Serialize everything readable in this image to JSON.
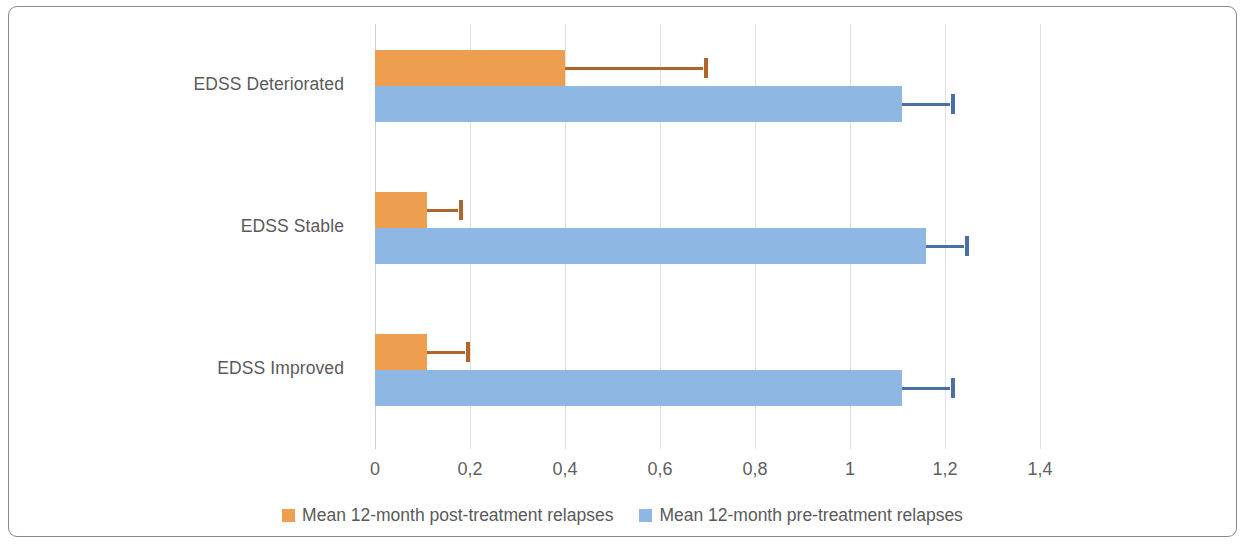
{
  "chart_data": {
    "type": "bar",
    "orientation": "horizontal",
    "title": "",
    "xlabel": "",
    "ylabel": "",
    "xlim": [
      0,
      1.4
    ],
    "xticks": [
      0,
      0.2,
      0.4,
      0.6,
      0.8,
      1,
      1.2,
      1.4
    ],
    "xtick_labels": [
      "0",
      "0,2",
      "0,4",
      "0,6",
      "0,8",
      "1",
      "1,2",
      "1,4"
    ],
    "grid": true,
    "legend_position": "bottom",
    "decimal_separator": ",",
    "categories": [
      "EDSS Improved",
      "EDSS Stable",
      "EDSS Deteriorated"
    ],
    "categories_top_to_bottom": [
      "EDSS Deteriorated",
      "EDSS Stable",
      "EDSS Improved"
    ],
    "series": [
      {
        "name": "Mean 12-month post-treatment relapses",
        "color": "#ED9E4F",
        "error_color": "#B0652B",
        "values": [
          0.11,
          0.11,
          0.4
        ],
        "values_top_to_bottom": [
          0.4,
          0.11,
          0.11
        ],
        "error_upper": [
          0.2,
          0.185,
          0.7
        ],
        "error_upper_top_to_bottom": [
          0.7,
          0.185,
          0.2
        ]
      },
      {
        "name": "Mean 12-month pre-treatment relapses",
        "color": "#8FB7E3",
        "error_color": "#4A6FA8",
        "values": [
          1.11,
          1.16,
          1.11
        ],
        "values_top_to_bottom": [
          1.11,
          1.16,
          1.11
        ],
        "error_upper": [
          1.22,
          1.25,
          1.22
        ],
        "error_upper_top_to_bottom": [
          1.22,
          1.25,
          1.22
        ]
      }
    ],
    "groups_top_to_bottom": [
      {
        "category": "EDSS Deteriorated",
        "bars": [
          {
            "series": "Mean 12-month post-treatment relapses",
            "value": 0.4,
            "error_upper": 0.7
          },
          {
            "series": "Mean 12-month pre-treatment relapses",
            "value": 1.11,
            "error_upper": 1.22
          }
        ]
      },
      {
        "category": "EDSS Stable",
        "bars": [
          {
            "series": "Mean 12-month post-treatment relapses",
            "value": 0.11,
            "error_upper": 0.185
          },
          {
            "series": "Mean 12-month pre-treatment relapses",
            "value": 1.16,
            "error_upper": 1.25
          }
        ]
      },
      {
        "category": "EDSS Improved",
        "bars": [
          {
            "series": "Mean 12-month post-treatment relapses",
            "value": 0.11,
            "error_upper": 0.2
          },
          {
            "series": "Mean 12-month pre-treatment relapses",
            "value": 1.11,
            "error_upper": 1.22
          }
        ]
      }
    ],
    "legend": [
      {
        "label": "Mean 12-month post-treatment relapses",
        "color": "#ED9E4F"
      },
      {
        "label": "Mean 12-month pre-treatment relapses",
        "color": "#8FB7E3"
      }
    ]
  },
  "figure": {
    "border_color": "#8a8a8a",
    "background": "#ffffff",
    "gridline_color": "#e0e0e0",
    "text_color": "#5a5a5a"
  }
}
